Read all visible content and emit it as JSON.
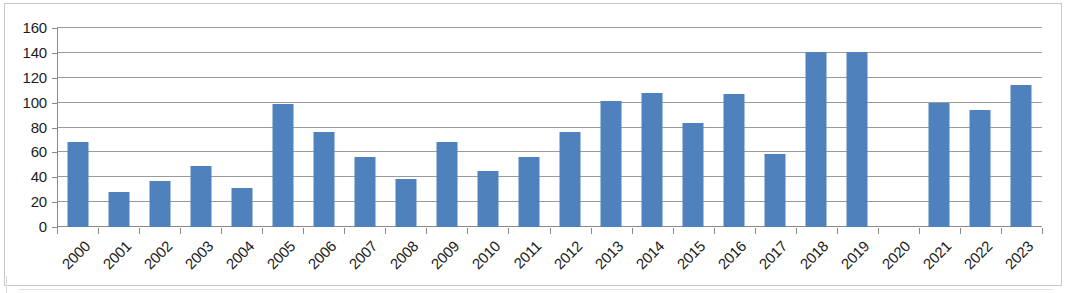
{
  "chart_data": {
    "type": "bar",
    "title": "",
    "subtitle": "",
    "xlabel": "",
    "ylabel": "",
    "legend": [],
    "legend_position": "none",
    "grid": true,
    "grid_axis": "y",
    "ylim": [
      0,
      160
    ],
    "y_ticks": [
      0,
      20,
      40,
      60,
      80,
      100,
      120,
      140,
      160
    ],
    "y_tick_labels": [
      "0",
      "20",
      "40",
      "60",
      "80",
      "100",
      "120",
      "140",
      "160"
    ],
    "x_label_rotation": -45,
    "bar_color": "#4F81BD",
    "gridline_color": "#9A9A9A",
    "axis_color": "#8A8A8A",
    "plot_background": "#FFFFFF",
    "border_color": "#C9C9C9",
    "categories": [
      "2000",
      "2001",
      "2002",
      "2003",
      "2004",
      "2005",
      "2006",
      "2007",
      "2008",
      "2009",
      "2010",
      "2011",
      "2012",
      "2013",
      "2014",
      "2015",
      "2016",
      "2017",
      "2018",
      "2019",
      "2020",
      "2021",
      "2022",
      "2023"
    ],
    "values": [
      68,
      28,
      37,
      49,
      31,
      99,
      76,
      56,
      39,
      68,
      45,
      56,
      76,
      101,
      108,
      84,
      107,
      59,
      141,
      141,
      0,
      100,
      94,
      114
    ],
    "series": [
      {
        "name": "Series 1",
        "color": "#4F81BD",
        "values": [
          68,
          28,
          37,
          49,
          31,
          99,
          76,
          56,
          39,
          68,
          45,
          56,
          76,
          101,
          108,
          84,
          107,
          59,
          141,
          141,
          0,
          100,
          94,
          114
        ]
      }
    ]
  }
}
